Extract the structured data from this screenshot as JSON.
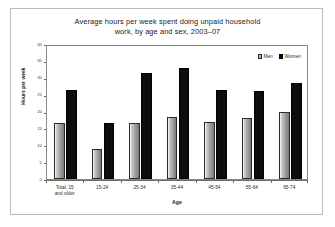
{
  "chart_data": {
    "type": "bar",
    "title": "Average hours per week spent doing unpaid household work, by age and sex, 2003–07",
    "title_line1": "Average hours per week spent doing unpaid household",
    "title_line2": "work, by age and sex, 2003–07",
    "xlabel": "Age",
    "ylabel": "Hours per week",
    "ylim": [
      0,
      40
    ],
    "ytick_labels": [
      "40",
      "35",
      "30",
      "25",
      "20",
      "15",
      "10",
      "5",
      "0"
    ],
    "yticks": [
      40,
      35,
      30,
      25,
      20,
      15,
      10,
      5,
      0
    ],
    "grid": false,
    "legend_position": "top-right",
    "categories": [
      "Total, 15 and older",
      "15-24",
      "25-34",
      "35-44",
      "45-54",
      "55-64",
      "65-74"
    ],
    "category_lines": [
      [
        "Total, 15",
        "and older"
      ],
      [
        "15-24",
        ""
      ],
      [
        "25-34",
        ""
      ],
      [
        "35-44",
        ""
      ],
      [
        "45-54",
        ""
      ],
      [
        "55-64",
        ""
      ],
      [
        "65-74",
        ""
      ]
    ],
    "series": [
      {
        "name": "Men",
        "color": "#a8a8a8",
        "values": [
          16.5,
          9.0,
          16.5,
          18.5,
          17.0,
          18.0,
          19.8
        ]
      },
      {
        "name": "Women",
        "color": "#0d0d0d",
        "values": [
          26.5,
          16.5,
          31.5,
          33.0,
          26.5,
          26.0,
          28.5
        ]
      }
    ]
  },
  "legend": {
    "items": [
      {
        "label": "Men",
        "swatch": "men"
      },
      {
        "label": "Women",
        "swatch": "women"
      }
    ]
  }
}
